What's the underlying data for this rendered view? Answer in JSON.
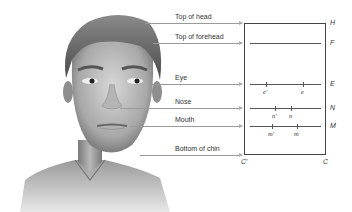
{
  "diagram": {
    "levels": [
      {
        "id": "head",
        "label": "Top of head",
        "letter": "H",
        "y": 23
      },
      {
        "id": "forehead",
        "label": "Top of forehead",
        "letter": "F",
        "y": 43
      },
      {
        "id": "eye",
        "label": "Eye",
        "letter": "E",
        "y": 84
      },
      {
        "id": "nose",
        "label": "Nose",
        "letter": "N",
        "y": 108
      },
      {
        "id": "mouth",
        "label": "Mouth",
        "letter": "M",
        "y": 126
      },
      {
        "id": "chin",
        "label": "Bottom of chin",
        "letter": "C",
        "y": 155
      }
    ],
    "ticks": {
      "eye": [
        {
          "label": "e'"
        },
        {
          "label": "e"
        }
      ],
      "nose": [
        {
          "label": "n'"
        },
        {
          "label": "n"
        }
      ],
      "mouth": [
        {
          "label": "m'"
        },
        {
          "label": "m"
        }
      ]
    },
    "corner_labels": {
      "bottom_left": "C'",
      "bottom_right": "C"
    }
  }
}
